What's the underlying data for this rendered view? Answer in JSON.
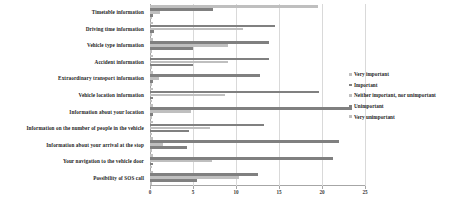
{
  "chart_data": {
    "type": "bar",
    "orientation": "horizontal",
    "title": "",
    "xlabel": "",
    "ylabel": "",
    "xlim": [
      0,
      25
    ],
    "xticks": [
      0,
      5,
      10,
      15,
      20,
      25
    ],
    "grid": true,
    "legend_position": "right",
    "categories": [
      "Timetable information",
      "Driving time information",
      "Vehicle type information",
      "Accident information",
      "Extraordinary transport information",
      "Vehicle location information",
      "Information about your location",
      "Information on the number of people in the vehicle",
      "Information about your arrival at the stop",
      "Your navigation to the vehicle door",
      "Possibility of SOS call"
    ],
    "series": [
      {
        "name": "Very important",
        "color": "#bfbfbf",
        "values": [
          19.5,
          0.4,
          0.3,
          0.3,
          0.3,
          0.4,
          0.3,
          0.3,
          0.3,
          0.3,
          0.4
        ]
      },
      {
        "name": "Important",
        "color": "#808080",
        "values": [
          7.3,
          14.5,
          13.8,
          13.8,
          12.8,
          19.7,
          23.5,
          13.3,
          22.0,
          21.3,
          12.5
        ]
      },
      {
        "name": "Neither important, nor unimportant",
        "color": "#bfbfbf",
        "values": [
          1.2,
          10.8,
          9.1,
          9.1,
          1.0,
          8.7,
          4.8,
          7.0,
          1.5,
          7.2,
          10.3
        ]
      },
      {
        "name": "Unimportant",
        "color": "#808080",
        "values": [
          0.3,
          0.5,
          5.0,
          5.0,
          0.4,
          0.3,
          0.3,
          4.5,
          4.3,
          0.3,
          5.5
        ]
      },
      {
        "name": "Very unimportant",
        "color": "#bfbfbf",
        "values": [
          0.2,
          0.2,
          0.2,
          0.2,
          0.2,
          0.2,
          0.2,
          0.2,
          0.2,
          0.2,
          0.2
        ]
      }
    ],
    "legend": [
      {
        "label": "Very important",
        "color": "#bfbfbf"
      },
      {
        "label": "Important",
        "color": "#808080"
      },
      {
        "label": "Neither important, nor unimportant",
        "color": "#bfbfbf"
      },
      {
        "label": "Unimportant",
        "color": "#808080"
      },
      {
        "label": "Very unimportant",
        "color": "#bfbfbf"
      }
    ]
  }
}
